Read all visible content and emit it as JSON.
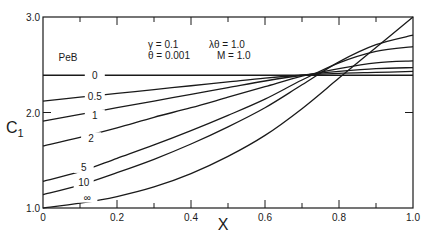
{
  "chart_data": {
    "type": "line",
    "title": "",
    "xlabel": "X",
    "ylabel": "C1",
    "xlim": [
      0,
      1.0
    ],
    "ylim": [
      1.0,
      3.0
    ],
    "x_ticks": [
      "0",
      "0.2",
      "0.4",
      "0.6",
      "0.8",
      "1.0"
    ],
    "y_ticks": [
      "1.0",
      "2.0",
      "3.0"
    ],
    "grid": false,
    "legend_title": "PeB",
    "parameters": {
      "gamma": "γ = 0.1",
      "theta": "θ = 0.001",
      "lambda_theta": "λθ = 1.0",
      "M": "M = 1.0"
    },
    "x": [
      0,
      0.1,
      0.2,
      0.3,
      0.4,
      0.5,
      0.6,
      0.7,
      0.8,
      0.9,
      1.0
    ],
    "series": [
      {
        "name": "0",
        "label": "0",
        "values": [
          2.39,
          2.39,
          2.39,
          2.39,
          2.39,
          2.39,
          2.39,
          2.39,
          2.39,
          2.39,
          2.39
        ]
      },
      {
        "name": "0.5",
        "label": "0.5",
        "values": [
          2.12,
          2.16,
          2.2,
          2.24,
          2.28,
          2.32,
          2.36,
          2.39,
          2.41,
          2.42,
          2.43
        ]
      },
      {
        "name": "1",
        "label": "1",
        "values": [
          1.91,
          1.98,
          2.05,
          2.12,
          2.19,
          2.26,
          2.33,
          2.39,
          2.43,
          2.46,
          2.47
        ]
      },
      {
        "name": "2",
        "label": "2",
        "values": [
          1.65,
          1.74,
          1.84,
          1.95,
          2.05,
          2.16,
          2.27,
          2.38,
          2.46,
          2.52,
          2.54
        ]
      },
      {
        "name": "5",
        "label": "5",
        "values": [
          1.28,
          1.38,
          1.52,
          1.66,
          1.81,
          1.97,
          2.14,
          2.34,
          2.52,
          2.64,
          2.69
        ]
      },
      {
        "name": "10",
        "label": "10",
        "values": [
          1.14,
          1.24,
          1.37,
          1.51,
          1.67,
          1.85,
          2.05,
          2.29,
          2.53,
          2.71,
          2.81
        ]
      },
      {
        "name": "inf",
        "label": "∞",
        "values": [
          1.0,
          1.05,
          1.12,
          1.22,
          1.36,
          1.54,
          1.76,
          2.04,
          2.36,
          2.68,
          3.0
        ]
      }
    ]
  },
  "labels": {
    "x_axis_title": "X",
    "y_axis_title_main": "C",
    "y_axis_title_sub": "1",
    "legend_title": "PeB",
    "param_gamma": "γ = 0.1",
    "param_theta": "θ = 0.001",
    "param_lambda_theta": "λθ = 1.0",
    "param_M": "M = 1.0"
  }
}
